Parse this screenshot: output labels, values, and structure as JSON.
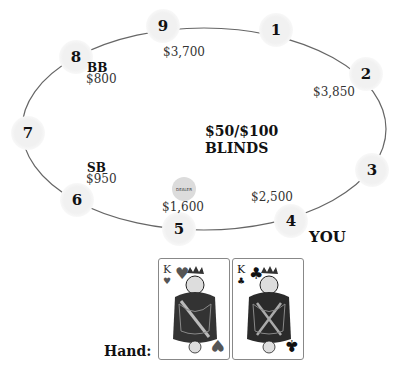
{
  "table": {
    "blinds_amount": "$50/$100",
    "blinds_label": "BLINDS",
    "dealer_label": "DEALER",
    "you_label": "YOU"
  },
  "seats": [
    {
      "number": "1",
      "stack": "",
      "role": ""
    },
    {
      "number": "2",
      "stack": "$3,850",
      "role": ""
    },
    {
      "number": "3",
      "stack": "",
      "role": ""
    },
    {
      "number": "4",
      "stack": "$2,500",
      "role": "",
      "is_you": true
    },
    {
      "number": "5",
      "stack": "$1,600",
      "role": "",
      "is_dealer": true
    },
    {
      "number": "6",
      "stack": "$950",
      "role": "SB"
    },
    {
      "number": "7",
      "stack": "",
      "role": ""
    },
    {
      "number": "8",
      "stack": "$800",
      "role": "BB"
    },
    {
      "number": "9",
      "stack": "$3,700",
      "role": ""
    }
  ],
  "hand": {
    "label": "Hand:",
    "cards": [
      {
        "rank": "K",
        "suit": "hearts",
        "suit_glyph": "♥",
        "color": "#333333"
      },
      {
        "rank": "K",
        "suit": "clubs",
        "suit_glyph": "♣",
        "color": "#000000"
      }
    ]
  }
}
